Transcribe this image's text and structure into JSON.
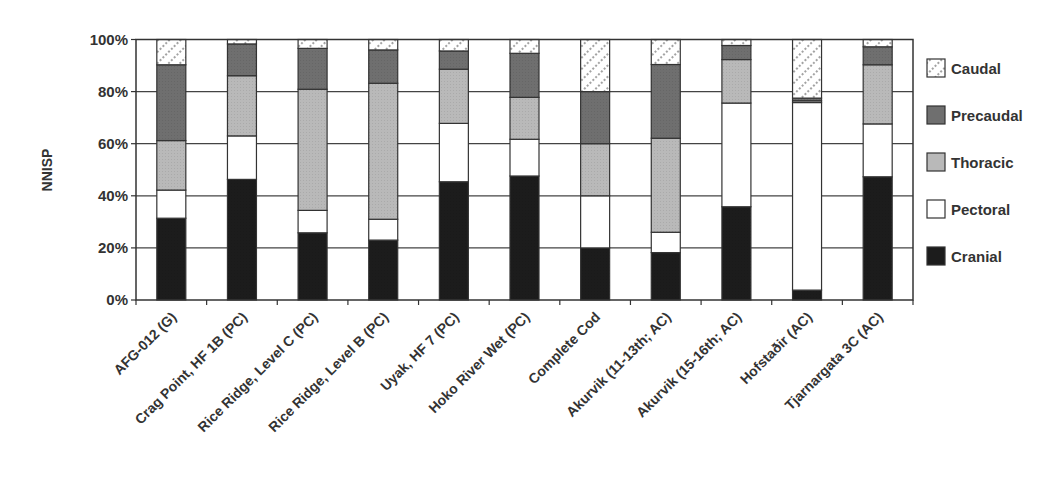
{
  "chart_data": {
    "type": "bar",
    "stacked": true,
    "normalized_percent": true,
    "title": "",
    "xlabel": "",
    "ylabel": "NNISP",
    "ylim": [
      0,
      100
    ],
    "yticks": [
      "0%",
      "20%",
      "40%",
      "60%",
      "80%",
      "100%"
    ],
    "grid": true,
    "legend_position": "right",
    "categories": [
      "AFG-012 (G)",
      "Crag Point, HF 1B (PC)",
      "Rice Ridge, Level C (PC)",
      "Rice Ridge, Level B (PC)",
      "Uyak, HF 7 (PC)",
      "Hoko River Wet (PC)",
      "Complete Cod",
      "Akurvik (11-13th; AC)",
      "Akurvik (15-16th; AC)",
      "Hofstaðir (AC)",
      "Tjarnargata 3C (AC)"
    ],
    "series": [
      {
        "name": "Cranial",
        "color": "#1c1c1c",
        "values": [
          31.4,
          46.3,
          25.8,
          23.0,
          45.4,
          47.6,
          20.0,
          18.2,
          35.8,
          3.8,
          47.3
        ]
      },
      {
        "name": "Pectoral",
        "color": "#ffffff",
        "values": [
          10.8,
          16.7,
          8.6,
          8.0,
          22.4,
          14.1,
          20.0,
          7.8,
          39.8,
          72.0,
          20.3
        ]
      },
      {
        "name": "Thoracic",
        "color": "#b9b9b9",
        "values": [
          19.0,
          23.1,
          46.5,
          52.2,
          20.8,
          16.1,
          20.0,
          36.1,
          16.7,
          0.7,
          22.7
        ]
      },
      {
        "name": "Precaudal",
        "color": "#6f6f6f",
        "values": [
          29.1,
          12.2,
          15.7,
          12.8,
          7.0,
          16.9,
          20.0,
          28.3,
          5.4,
          1.0,
          6.9
        ]
      },
      {
        "name": "Caudal",
        "color": "#ffffff",
        "pattern": "dotted-diagonal",
        "values": [
          9.7,
          1.7,
          3.4,
          4.0,
          4.4,
          5.3,
          20.0,
          9.6,
          2.3,
          22.5,
          2.8
        ]
      }
    ],
    "legend_order": [
      "Caudal",
      "Precaudal",
      "Thoracic",
      "Pectoral",
      "Cranial"
    ]
  }
}
